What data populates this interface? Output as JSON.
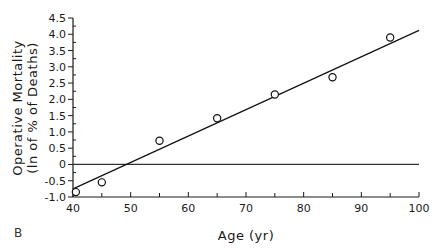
{
  "panel_label": "B",
  "chart_data": {
    "type": "scatter",
    "title": "",
    "xlabel": "Age (yr)",
    "ylabel_line1": "Operative Mortality",
    "ylabel_line2": "(ln of % of Deaths)",
    "xlim": [
      40,
      100
    ],
    "ylim": [
      -1.0,
      4.5
    ],
    "x_ticks": [
      40,
      50,
      60,
      70,
      80,
      90,
      100
    ],
    "y_ticks": [
      -1.0,
      -0.5,
      0,
      0.5,
      1.0,
      1.5,
      2.0,
      2.5,
      3.0,
      3.5,
      4.0,
      4.5
    ],
    "y_tick_labels": [
      "-1.0",
      "-0.5",
      "0",
      "0.5",
      "1.0",
      "1.5",
      "2.0",
      "2.5",
      "3.0",
      "3.5",
      "4.0",
      "4.5"
    ],
    "grid": false,
    "legend": null,
    "series": [
      {
        "name": "Observed",
        "marker": "open-circle",
        "x": [
          40.5,
          45,
          55,
          65,
          75,
          85,
          95
        ],
        "y": [
          -0.85,
          -0.55,
          0.73,
          1.42,
          2.15,
          2.68,
          3.9
        ]
      }
    ],
    "regression_line": {
      "x": [
        40,
        100
      ],
      "y": [
        -0.75,
        4.12
      ]
    },
    "reference_line": {
      "y": 0,
      "x": [
        40,
        100
      ]
    }
  }
}
